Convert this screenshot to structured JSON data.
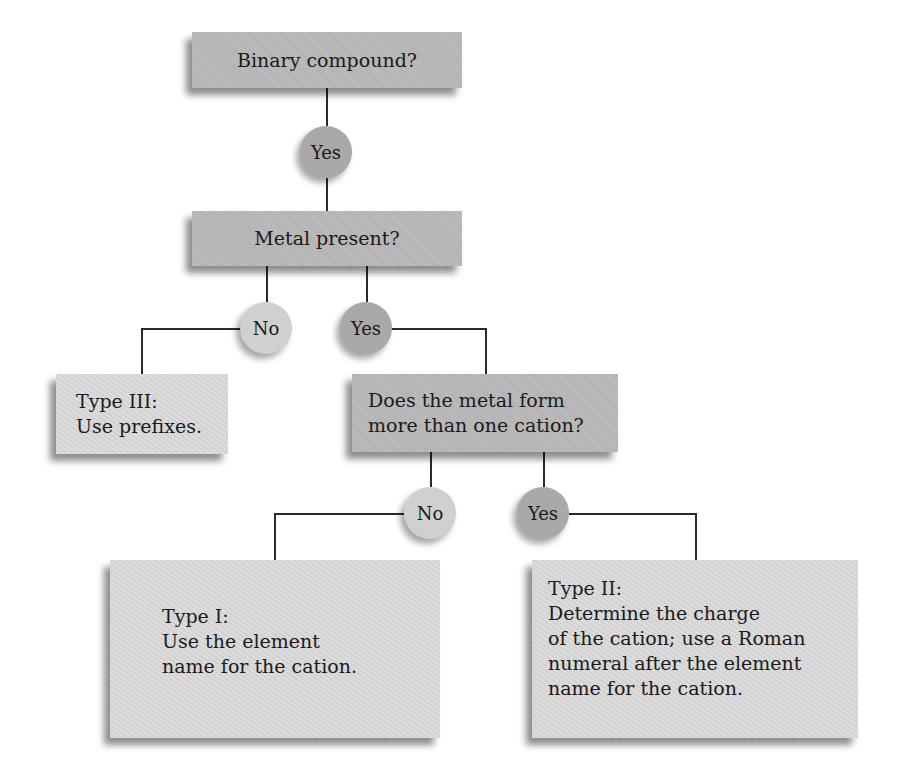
{
  "diagram": {
    "type": "flowchart",
    "nodes": {
      "binary": {
        "label": "Binary compound?"
      },
      "yes1": {
        "label": "Yes"
      },
      "metal": {
        "label": "Metal present?"
      },
      "no1": {
        "label": "No"
      },
      "yes2": {
        "label": "Yes"
      },
      "type3": {
        "label": "Type III:\nUse prefixes."
      },
      "cation": {
        "label": "Does the metal form\nmore than one cation?"
      },
      "no2": {
        "label": "No"
      },
      "yes3": {
        "label": "Yes"
      },
      "type1": {
        "label": "Type I:\nUse the element\nname for the cation."
      },
      "type2": {
        "label": "Type II:\nDetermine the charge\nof the cation; use a Roman\nnumeral  after the element\nname for the cation."
      }
    },
    "edges": [
      {
        "from": "binary",
        "to": "yes1"
      },
      {
        "from": "yes1",
        "to": "metal"
      },
      {
        "from": "metal",
        "to": "no1"
      },
      {
        "from": "no1",
        "to": "type3"
      },
      {
        "from": "metal",
        "to": "yes2"
      },
      {
        "from": "yes2",
        "to": "cation"
      },
      {
        "from": "cation",
        "to": "no2"
      },
      {
        "from": "no2",
        "to": "type1"
      },
      {
        "from": "cation",
        "to": "yes3"
      },
      {
        "from": "yes3",
        "to": "type2"
      }
    ],
    "colors": {
      "decision_box": "#b8b8b8",
      "result_box": "#d9d9d9",
      "yes_circle": "#a9a9a9",
      "no_circle": "#d0d0d0",
      "connector": "#2a2a2a"
    }
  }
}
